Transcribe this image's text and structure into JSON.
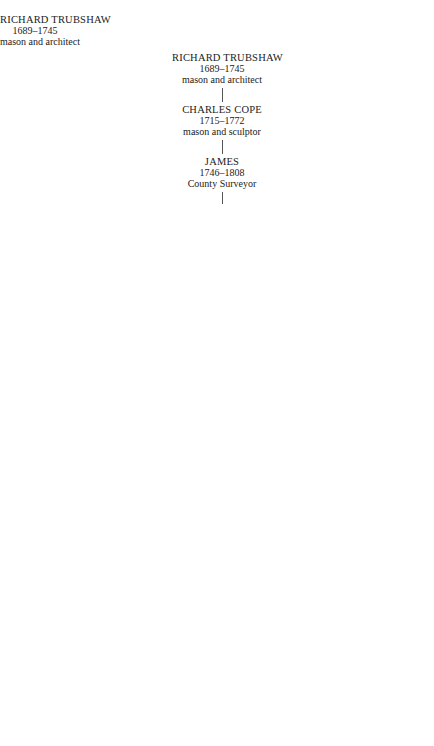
{
  "diagram": {
    "type": "family-tree",
    "nodes": {
      "richard": {
        "name": "RICHARD TRUBSHAW",
        "lines": [
          "1689–1745",
          "mason and architect"
        ]
      },
      "charles_cope": {
        "name": "CHARLES COPE",
        "lines": [
          "1715–1772",
          "mason and sculptor"
        ]
      },
      "james1746": {
        "name": "JAMES",
        "lines": [
          "1746–1808",
          "County Surveyor"
        ]
      },
      "john1776": {
        "name": "JOHN",
        "lines": [
          "1776–1834"
        ]
      },
      "james1777": {
        "name": "JAMES",
        "lines": [
          "1777–1853",
          "civil engineer"
        ]
      },
      "charles1779": {
        "name": "CHARLES",
        "lines": [
          "1779–1862",
          "mason of Longton"
        ]
      },
      "george": {
        "name": "GEORGE",
        "lines": [
          "1787–1852",
          "mason of Stafford"
        ]
      },
      "henry": {
        "name": "HENRY",
        "lines": [
          "1793–1860",
          "mason and",
          "brickmaker of",
          "Stafford"
        ]
      },
      "thomas": {
        "name": "THOMAS",
        "lines": [
          "1802–1842",
          "architect"
        ]
      },
      "mary": {
        "name": "Mary",
        "lines": [
          "1803–1873"
        ]
      },
      "thomas_johnson": {
        "name": "Thomas Johnson",
        "lines": [
          "1794–1865",
          "architect of",
          "Lichfield"
        ]
      },
      "james1804": {
        "name": "JAMES",
        "lines": [
          "1804–1875",
          "civil engineer"
        ]
      },
      "richard_hartley": {
        "name": "RICHARD HARTLEY",
        "lines": [
          "1836–1913",
          "naval engineer"
        ]
      },
      "james1837": {
        "name": "JAMES",
        "lines": [
          "1837–1867",
          "mason"
        ]
      },
      "john1809": {
        "name": "JOHN",
        "lines": [
          "1809–1877",
          "civil engineer"
        ]
      },
      "charles1811": {
        "name": "CHARLES",
        "lines": [
          "1811–1862",
          "civil engineer",
          "County Surveyor"
        ]
      },
      "james_trubshawe": {
        "name": "JAMES TRUBSHAWE",
        "lines": [
          "1817–",
          "Government Architect,",
          "India"
        ]
      },
      "charles1841": {
        "name": "CHARLES",
        "lines": [
          "1841–1917",
          "architect"
        ]
      },
      "vyvyan": {
        "name": "VYVYAN",
        "lines": [
          "1853–1924"
        ]
      },
      "wolstan": {
        "name": "WOLSTAN VYVYAN",
        "lines": [
          "1893–1981",
          "architect"
        ]
      }
    },
    "marriage_symbol": "="
  }
}
